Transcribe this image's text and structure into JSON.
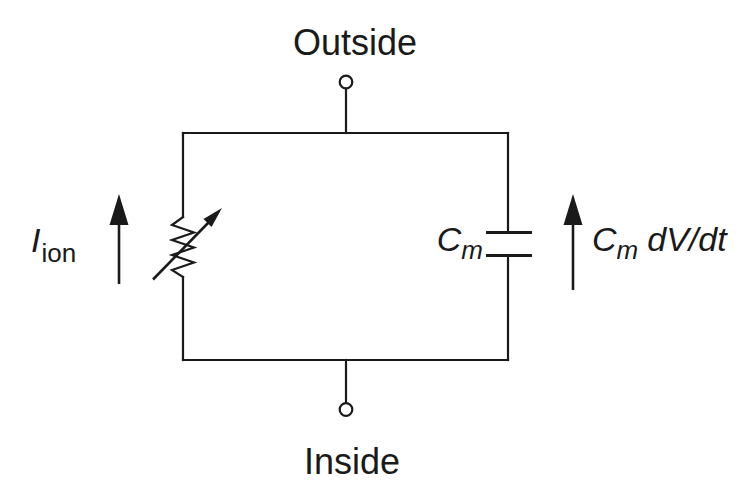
{
  "figure": {
    "colors": {
      "line": "#1a1a1a",
      "background": "#ffffff"
    },
    "labels": {
      "outside": "Outside",
      "inside": "Inside",
      "ion_current": {
        "symbol": "I",
        "subscript": "ion"
      },
      "capacitance": {
        "symbol": "C",
        "subscript": "m"
      },
      "capacitive_current": {
        "symbol": "C",
        "subscript": "m",
        "expression": "dV/dt"
      }
    }
  }
}
